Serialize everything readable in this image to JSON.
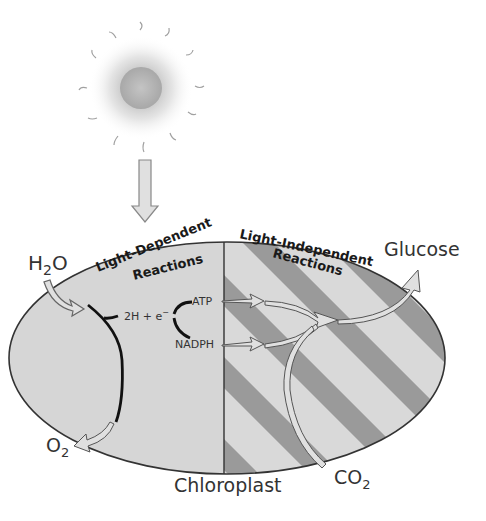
{
  "diagram": {
    "sun": {
      "icon": "sun-icon"
    },
    "organelle_label": "Chloroplast",
    "regions": {
      "light_dependent": {
        "line1": "Light-Dependent",
        "line2": "Reactions"
      },
      "light_independent": {
        "line1": "Light-Independent",
        "line2": "Reactions"
      }
    },
    "inputs": {
      "water": {
        "main": "H",
        "sub": "2",
        "tail": "O"
      },
      "carbon_dioxide": {
        "main": "CO",
        "sub": "2"
      }
    },
    "outputs": {
      "oxygen": {
        "main": "O",
        "sub": "2"
      },
      "glucose": "Glucose"
    },
    "intermediates": {
      "electrons": "2H + e",
      "electrons_sup": "−",
      "atp": "ATP",
      "nadph": "NADPH"
    },
    "colors": {
      "left_fill": "#d6d6d6",
      "stripe_light": "#d9d9d9",
      "stripe_dark": "#9a9a9a",
      "outline": "#333333",
      "arrow_fill": "#e0e0e0"
    }
  }
}
